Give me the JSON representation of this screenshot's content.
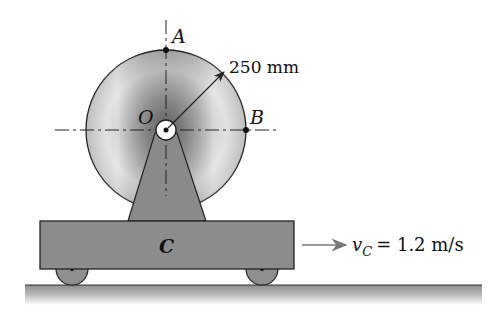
{
  "figure": {
    "labels": {
      "point_a": "A",
      "point_b": "B",
      "center_o": "O",
      "cart": "C",
      "radius_dim": "250 mm",
      "velocity_symbol": "v",
      "velocity_subscript": "C",
      "velocity_value": "= 1.2 m/s"
    },
    "colors": {
      "disk_dark": "#7a7a7a",
      "disk_light": "#f2f2f2",
      "cart_fill": "#8c8c8c",
      "support_fill": "#8a8a8a",
      "wheel_fill": "#8f8f8f",
      "ground_top": "#8e8e8e",
      "ground_bottom": "#ffffff",
      "line": "#222222",
      "arrow": "#777777"
    }
  }
}
